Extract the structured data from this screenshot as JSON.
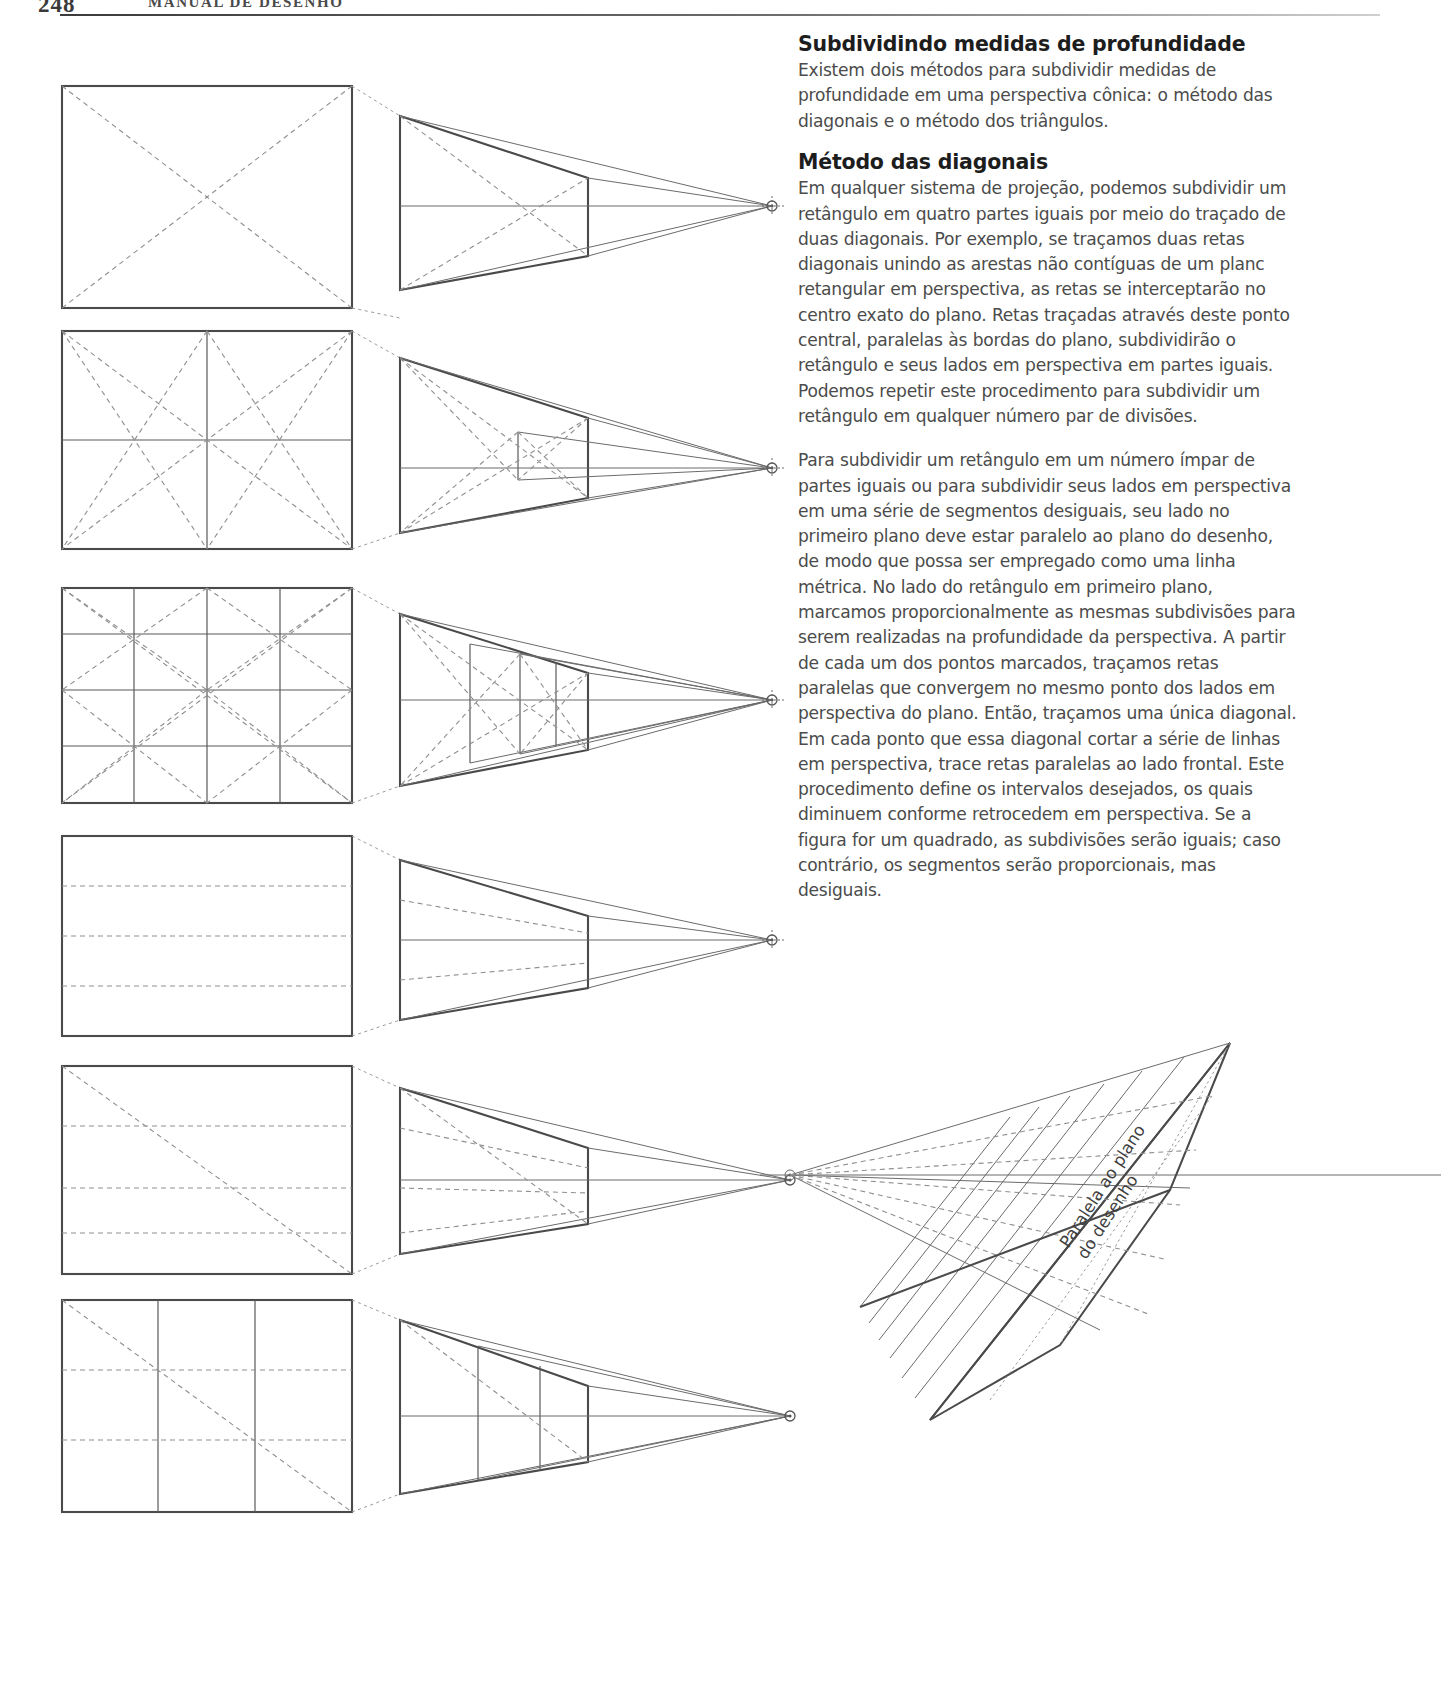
{
  "page": {
    "folio": "248",
    "running_head": "MANUAL DE DESENHO"
  },
  "text_column": {
    "section1_title": "Subdividindo medidas de profundidade",
    "section1_intro": "Existem dois métodos para subdividir medidas de profundidade em uma perspectiva cônica: o método das diagonais e o método dos triângulos.",
    "section2_title": "Método das diagonais",
    "paragraph1": "Em qualquer sistema de projeção, podemos subdividir um retângulo em quatro partes iguais por meio do traçado de duas diagonais. Por exemplo, se traçamos duas retas diagonais unindo as arestas não contíguas de um planc retangular em perspectiva, as retas se interceptarão no centro exato do plano. Retas traçadas através deste ponto central, paralelas às bordas do plano, subdividirão o retângulo e seus lados em perspectiva em partes iguais. Podemos repetir este procedimento para subdividir um retângulo em qualquer número par de divisões.",
    "paragraph2": "Para subdividir um retângulo em um número ímpar de partes iguais ou para subdividir seus lados em perspectiva em uma série de segmentos desiguais, seu lado no primeiro plano deve estar paralelo ao plano do desenho, de modo que possa ser empregado como uma linha métrica. No lado do retângulo em primeiro plano, marcamos proporcionalmente as mesmas subdivisões para serem realizadas na profundidade da perspectiva. A partir de cada um dos pontos marcados, traçamos retas paralelas que convergem no mesmo ponto dos lados em perspectiva do plano. Então, traçamos uma única diagonal. Em cada ponto que essa diagonal cortar a série de linhas em perspectiva, trace retas paralelas ao lado frontal. Este procedimento define os intervalos desejados, os quais diminuem conforme retrocedem em perspectiva. Se a figura for um quadrado, as subdivisões serão iguais; caso contrário, os segmentos serão proporcionais, mas desiguais."
  },
  "figures": {
    "caption_rotated": "Paralela ao plano\ndo desenho",
    "rows": [
      {
        "name": "row-1-diagonals-single",
        "divisions": 1,
        "has_diagonals": true
      },
      {
        "name": "row-2-diagonals-quarters",
        "divisions": 2,
        "has_diagonals": true
      },
      {
        "name": "row-3-diagonals-sixteenths",
        "divisions": 4,
        "has_diagonals": true
      },
      {
        "name": "row-4-horizontal-bands",
        "divisions": 0,
        "has_diagonals": false
      },
      {
        "name": "row-5-single-diagonal",
        "divisions": 0,
        "has_diagonals": true
      },
      {
        "name": "row-6-thirds",
        "divisions": 3,
        "has_diagonals": true
      }
    ]
  },
  "colors": {
    "ink": "#3f3f3f",
    "solid_line": "#4a4a4a",
    "dashed_line": "#8a8a8a",
    "body_text": "#4b4b4b",
    "heading": "#1d1d1d"
  }
}
